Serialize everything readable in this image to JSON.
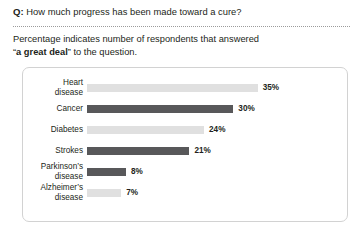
{
  "header": {
    "q_marker": "Q:",
    "question": "How much progress has been made toward a cure?"
  },
  "subtitle": {
    "line1_before": "Percentage indicates number of respondents that answered",
    "quote_open": "“",
    "emphasis": "a great deal",
    "quote_close": "”",
    "line2_after": " to the question."
  },
  "chart_data": {
    "type": "bar",
    "orientation": "horizontal",
    "title": "How much progress has been made toward a cure?",
    "subtitle": "Percentage indicates number of respondents that answered “a great deal” to the question.",
    "xlabel": "",
    "ylabel": "",
    "xlim": [
      0,
      41
    ],
    "grid": false,
    "legend": false,
    "value_suffix": "%",
    "categories": [
      "Heart\ndisease",
      "Cancer",
      "Diabetes",
      "Strokes",
      "Parkinson’s\ndisease",
      "Alzheimer’s\ndisease"
    ],
    "values": [
      35,
      30,
      24,
      21,
      8,
      7
    ],
    "value_labels": [
      "35%",
      "30%",
      "24%",
      "21%",
      "8%",
      "7%"
    ],
    "bar_colors": [
      "#e0e0e0",
      "#58585a",
      "#e0e0e0",
      "#58585a",
      "#58585a",
      "#e0e0e0"
    ],
    "colors": {
      "light_bar": "#e0e0e0",
      "dark_bar": "#58585a",
      "text": "#231f20",
      "card_border": "#d2d2d2",
      "divider": "#9b9b9b",
      "background": "#ffffff"
    }
  }
}
